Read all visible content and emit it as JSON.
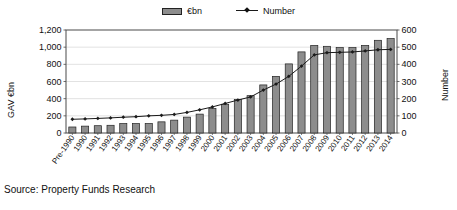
{
  "legend": {
    "position": "top-center",
    "entries": [
      {
        "label": "€bn",
        "marker": "bar-swatch-icon",
        "color": "#8d8d8d"
      },
      {
        "label": "Number",
        "marker": "line-marker-icon",
        "color": "#1a1a1a"
      }
    ]
  },
  "source": {
    "text": "Source: Property Funds Research"
  },
  "axes": {
    "left": {
      "title": "GAV €bn",
      "ticks": [
        "0",
        "200",
        "400",
        "600",
        "800",
        "1,000",
        "1,200"
      ]
    },
    "right": {
      "title": "Number",
      "ticks": [
        "0",
        "100",
        "200",
        "300",
        "400",
        "500",
        "600"
      ]
    }
  },
  "chart_data": {
    "type": "bar",
    "title": "",
    "subtitle": "",
    "xlabel": "",
    "ylabel": "GAV €bn",
    "y2label": "Number",
    "ylim": [
      0,
      1200
    ],
    "y2lim": [
      0,
      600
    ],
    "ytick_step": 200,
    "y2tick_step": 100,
    "grid": true,
    "grid_axis": "y",
    "legend_position": "top-center",
    "categories": [
      "Pre-1990",
      "1990",
      "1991",
      "1992",
      "1993",
      "1994",
      "1995",
      "1996",
      "1997",
      "1998",
      "1999",
      "2000",
      "2001",
      "2002",
      "2003",
      "2004",
      "2005",
      "2006",
      "2007",
      "2008",
      "2009",
      "2010",
      "2011",
      "2012",
      "2013",
      "2014"
    ],
    "series": [
      {
        "name": "€bn",
        "type": "bar",
        "axis": "left",
        "color": "#8d8d8d",
        "edge_color": "#222222",
        "values": [
          70,
          80,
          85,
          90,
          110,
          110,
          110,
          130,
          150,
          185,
          220,
          285,
          335,
          390,
          435,
          560,
          660,
          805,
          945,
          1020,
          1010,
          995,
          995,
          1020,
          1080,
          1100
        ]
      },
      {
        "name": "Number",
        "type": "line",
        "axis": "right",
        "color": "#1a1a1a",
        "marker": "diamond",
        "values": [
          80,
          82,
          85,
          88,
          92,
          95,
          100,
          103,
          108,
          120,
          135,
          152,
          172,
          192,
          210,
          250,
          285,
          330,
          390,
          455,
          468,
          470,
          472,
          478,
          485,
          487
        ]
      }
    ]
  }
}
